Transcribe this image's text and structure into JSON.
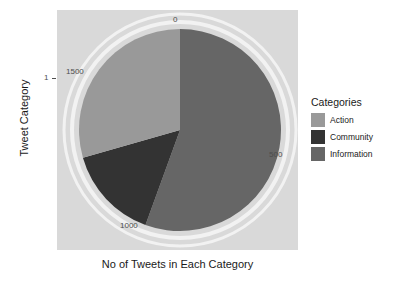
{
  "chart_data": {
    "type": "pie",
    "title": "",
    "xlabel": "No of Tweets in Each Category",
    "ylabel": "Tweet Category",
    "categories": [
      "Action",
      "Community",
      "Information"
    ],
    "values": [
      530,
      270,
      1000
    ],
    "total": 1800,
    "legend_title": "Categories",
    "legend_position": "right",
    "grid": false,
    "axis_tick_labels": [
      "0",
      "500",
      "1000",
      "1500"
    ],
    "axis_tick_values": [
      0,
      500,
      1000,
      1500
    ],
    "axis_range": [
      0,
      1800
    ],
    "y_tick_labels": [
      "1"
    ],
    "colors": {
      "Action": "#999999",
      "Community": "#333333",
      "Information": "#666666",
      "panel": "#d9d9d9",
      "ring": "#f2f2f2",
      "background": "#ffffff",
      "text": "#1a1a1a",
      "axis_text": "#4d4d4d"
    },
    "slices": [
      {
        "label": "Information",
        "value": 1000,
        "start_deg": 0,
        "end_deg": 200,
        "color": "#666666"
      },
      {
        "label": "Community",
        "value": 270,
        "start_deg": 200,
        "end_deg": 254,
        "color": "#333333"
      },
      {
        "label": "Action",
        "value": 530,
        "start_deg": 254,
        "end_deg": 360,
        "color": "#999999"
      }
    ]
  },
  "axis": {
    "x_title": "No of Tweets in Each Category",
    "y_title": "Tweet Category",
    "y_tick": "1",
    "labels": {
      "zero": "0",
      "five_hundred": "500",
      "one_thousand": "1000",
      "fifteen_hundred": "1500"
    }
  },
  "legend": {
    "title": "Categories",
    "items": [
      {
        "label": "Action",
        "color": "#999999"
      },
      {
        "label": "Community",
        "color": "#333333"
      },
      {
        "label": "Information",
        "color": "#666666"
      }
    ]
  }
}
